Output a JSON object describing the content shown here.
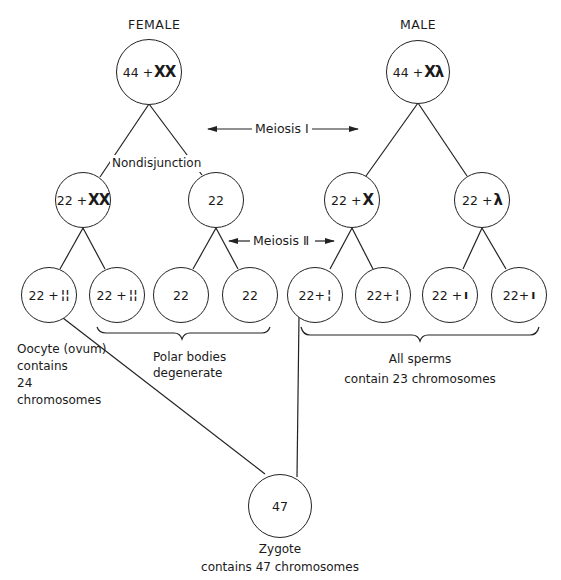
{
  "headers": {
    "female": "FEMALE",
    "male": "MALE"
  },
  "arrows": {
    "meiosis1": "Meiosis Ⅰ",
    "meiosis2": "Meiosis Ⅱ"
  },
  "annotations": {
    "nondisjunction": "Nondisjunction"
  },
  "female": {
    "parent": {
      "autosomes": "44 +",
      "sex": "ΧΧ"
    },
    "meiosis1": [
      {
        "autosomes": "22 +",
        "sex": "ΧΧ"
      },
      {
        "autosomes": "22",
        "sex": ""
      }
    ],
    "meiosis2": [
      {
        "autosomes": "22 +",
        "sex": "¦¦"
      },
      {
        "autosomes": "22 +",
        "sex": "¦¦"
      },
      {
        "autosomes": "22",
        "sex": ""
      },
      {
        "autosomes": "22",
        "sex": ""
      }
    ]
  },
  "male": {
    "parent": {
      "autosomes": "44 +",
      "sex": "Χλ"
    },
    "meiosis1": [
      {
        "autosomes": "22 +",
        "sex": "Χ"
      },
      {
        "autosomes": "22 +",
        "sex": "λ"
      }
    ],
    "meiosis2": [
      {
        "autosomes": "22+",
        "sex": "¦"
      },
      {
        "autosomes": "22+",
        "sex": "¦"
      },
      {
        "autosomes": "22 +",
        "sex": "ı"
      },
      {
        "autosomes": "22+",
        "sex": "ı"
      }
    ]
  },
  "labels": {
    "oocyte": [
      "Oocyte (ovum)",
      "contains",
      "24",
      "chromosomes"
    ],
    "polar_bodies": [
      "Polar bodies",
      "degenerate"
    ],
    "sperms": [
      "All sperms",
      "contain 23 chromosomes"
    ]
  },
  "zygote": {
    "count": "47",
    "caption": [
      "Zygote",
      "contains 47 chromosomes"
    ]
  }
}
